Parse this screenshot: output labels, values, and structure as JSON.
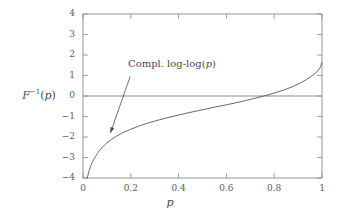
{
  "chart_data": {
    "type": "line",
    "title": "",
    "xlabel": "p",
    "ylabel": "F⁻¹(p)",
    "ylabel_parts": {
      "base": "F",
      "exponent": "-1",
      "arg": "p"
    },
    "xlim": [
      0,
      1
    ],
    "ylim": [
      -4,
      4
    ],
    "grid": false,
    "legend": "none",
    "axis_color": "#8a8a8a",
    "curve_color": "#555555",
    "annotation_color": "#4a4a4a",
    "zero_line": {
      "y": 0,
      "label": "zero-reference-line"
    },
    "xticks": [
      "0",
      "0.2",
      "0.4",
      "0.6",
      "0.8",
      "1"
    ],
    "xtick_values": [
      0,
      0.2,
      0.4,
      0.6,
      0.8,
      1
    ],
    "yticks": [
      "4",
      "3",
      "2",
      "1",
      "0",
      "-1",
      "-2",
      "-3",
      "-4"
    ],
    "ytick_values": [
      4,
      3,
      2,
      1,
      0,
      -1,
      -2,
      -3,
      -4
    ],
    "annotations": [
      {
        "text": "Compl. log-log(p)",
        "text_parts": {
          "prefix": "Compl. log-log(",
          "italic": "p",
          "suffix": ")"
        },
        "x": 0.21,
        "y": 1.15,
        "arrow_to_x": 0.115,
        "arrow_to_y": -1.8
      }
    ],
    "series": [
      {
        "name": "Compl. log-log(p)",
        "x": [
          0.018,
          0.022,
          0.026,
          0.03,
          0.035,
          0.04,
          0.046,
          0.052,
          0.06,
          0.07,
          0.08,
          0.09,
          0.1,
          0.12,
          0.14,
          0.16,
          0.18,
          0.2,
          0.24,
          0.28,
          0.32,
          0.36,
          0.4,
          0.44,
          0.48,
          0.52,
          0.56,
          0.6,
          0.64,
          0.653,
          0.68,
          0.72,
          0.76,
          0.8,
          0.84,
          0.88,
          0.91,
          0.935,
          0.955,
          0.97,
          0.98,
          0.987,
          0.992,
          0.996,
          0.999
        ],
        "y": [
          -4.0,
          -3.8,
          -3.63,
          -3.49,
          -3.34,
          -3.21,
          -3.08,
          -2.96,
          -2.81,
          -2.65,
          -2.51,
          -2.39,
          -2.29,
          -2.11,
          -1.96,
          -1.83,
          -1.72,
          -1.62,
          -1.44,
          -1.29,
          -1.16,
          -1.04,
          -0.93,
          -0.82,
          -0.72,
          -0.62,
          -0.52,
          -0.43,
          -0.33,
          -0.3,
          -0.22,
          -0.11,
          0.01,
          0.14,
          0.29,
          0.47,
          0.64,
          0.8,
          0.96,
          1.09,
          1.21,
          1.31,
          1.39,
          1.49,
          1.62
        ]
      }
    ]
  },
  "figure": {
    "plot_area": {
      "left": 83,
      "top": 14,
      "right": 322,
      "bottom": 178
    }
  }
}
